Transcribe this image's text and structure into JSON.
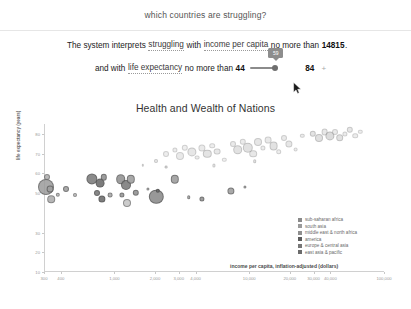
{
  "query": {
    "text": "which countries are struggling?"
  },
  "interpretation": {
    "line1": {
      "prefix": "The system interprets",
      "concept": "struggling",
      "connector": "with",
      "measure": "income per capita",
      "comparator": "no more than",
      "value": "14815",
      "period": "."
    },
    "line2": {
      "prefix": "and with",
      "measure": "life expectancy",
      "comparator": "no more than",
      "min_value": "44",
      "slider_tooltip": "59",
      "max_value": "84",
      "add_label": "+"
    }
  },
  "chart_data": {
    "type": "scatter",
    "title": "Health and Wealth of Nations",
    "xlabel": "income per capita, inflation-adjusted (dollars)",
    "ylabel": "life expectancy (years)",
    "xscale": "log",
    "xlim": [
      300,
      100000
    ],
    "ylim": [
      10,
      85
    ],
    "grid": false,
    "legend_position": "bottom-right",
    "xticks": [
      "300",
      "400",
      "1,000",
      "2,000",
      "3,000",
      "4,000",
      "10,000",
      "20,000",
      "30,000",
      "40,000",
      "100,000"
    ],
    "yticks": [
      "80",
      "70",
      "60",
      "50",
      "30",
      "20",
      "10"
    ],
    "legend": [
      {
        "label": "sub-saharan africa",
        "color": "#8a8a8a"
      },
      {
        "label": "south asia",
        "color": "#9a9a9a"
      },
      {
        "label": "middle east & north africa",
        "color": "#8f8f8f"
      },
      {
        "label": "america",
        "color": "#5c5c5c"
      },
      {
        "label": "europe & central asia",
        "color": "#777777"
      },
      {
        "label": "east asia & pacific",
        "color": "#6b6b6b"
      }
    ],
    "points": [
      {
        "x": 0.5,
        "y": 53,
        "r": 8.0,
        "c": "#9b9b9b",
        "o": 0.85
      },
      {
        "x": 1.0,
        "y": 58,
        "r": 3.0,
        "c": "#a8a8a8",
        "o": 0.8
      },
      {
        "x": 1.8,
        "y": 52,
        "r": 3.4,
        "c": "#9e9e9e",
        "o": 0.85
      },
      {
        "x": 2.2,
        "y": 47,
        "r": 3.8,
        "c": "#a5a5a5",
        "o": 0.8
      },
      {
        "x": 4.0,
        "y": 49,
        "r": 2.2,
        "c": "#b0b0b0",
        "o": 0.8
      },
      {
        "x": 6.5,
        "y": 52,
        "r": 3.0,
        "c": "#9c9c9c",
        "o": 0.85
      },
      {
        "x": 9.0,
        "y": 49,
        "r": 2.0,
        "c": "#b4b4b4",
        "o": 0.8
      },
      {
        "x": 14.0,
        "y": 57,
        "r": 5.6,
        "c": "#7c7c7c",
        "o": 0.88
      },
      {
        "x": 16.5,
        "y": 55,
        "r": 4.4,
        "c": "#6e6e6e",
        "o": 0.9
      },
      {
        "x": 17.5,
        "y": 58,
        "r": 3.2,
        "c": "#8b8b8b",
        "o": 0.85
      },
      {
        "x": 15.5,
        "y": 50,
        "r": 3.0,
        "c": "#777777",
        "o": 0.88
      },
      {
        "x": 17.0,
        "y": 47,
        "r": 3.6,
        "c": "#6f6f6f",
        "o": 0.9
      },
      {
        "x": 19.5,
        "y": 49,
        "r": 2.4,
        "c": "#a0a0a0",
        "o": 0.82
      },
      {
        "x": 22.5,
        "y": 57,
        "r": 4.8,
        "c": "#8e8e8e",
        "o": 0.85
      },
      {
        "x": 24.0,
        "y": 54,
        "r": 5.0,
        "c": "#7a7a7a",
        "o": 0.88
      },
      {
        "x": 25.5,
        "y": 57,
        "r": 4.2,
        "c": "#9a9a9a",
        "o": 0.85
      },
      {
        "x": 23.0,
        "y": 49,
        "r": 2.6,
        "c": "#909090",
        "o": 0.84
      },
      {
        "x": 24.5,
        "y": 45,
        "r": 4.0,
        "c": "#c0c0c0",
        "o": 0.8
      },
      {
        "x": 27.0,
        "y": 50,
        "r": 3.2,
        "c": "#8c8c8c",
        "o": 0.85
      },
      {
        "x": 30.5,
        "y": 52,
        "r": 1.6,
        "c": "#a6a6a6",
        "o": 0.8
      },
      {
        "x": 33.0,
        "y": 48,
        "r": 7.2,
        "c": "#8a8a8a",
        "o": 0.88
      },
      {
        "x": 33.5,
        "y": 51,
        "r": 2.2,
        "c": "#6c6c6c",
        "o": 0.9
      },
      {
        "x": 38.5,
        "y": 57,
        "r": 4.2,
        "c": "#989898",
        "o": 0.85
      },
      {
        "x": 42.5,
        "y": 48,
        "r": 1.8,
        "c": "#a4a4a4",
        "o": 0.82
      },
      {
        "x": 46.5,
        "y": 47,
        "r": 2.6,
        "c": "#8f8f8f",
        "o": 0.85
      },
      {
        "x": 55.0,
        "y": 51,
        "r": 3.6,
        "c": "#9b9b9b",
        "o": 0.85
      },
      {
        "x": 59.0,
        "y": 53,
        "r": 1.6,
        "c": "#a0a0a0",
        "o": 0.8
      },
      {
        "x": 33.0,
        "y": 66,
        "r": 2.0,
        "c": "#d8d8d8",
        "o": 0.55
      },
      {
        "x": 36.0,
        "y": 70,
        "r": 3.0,
        "c": "#dcdcdc",
        "o": 0.5
      },
      {
        "x": 38.5,
        "y": 72,
        "r": 2.6,
        "c": "#dadada",
        "o": 0.5
      },
      {
        "x": 40.0,
        "y": 69,
        "r": 4.0,
        "c": "#d5d5d5",
        "o": 0.5
      },
      {
        "x": 41.5,
        "y": 73,
        "r": 3.2,
        "c": "#dedede",
        "o": 0.5
      },
      {
        "x": 43.5,
        "y": 71,
        "r": 4.6,
        "c": "#d2d2d2",
        "o": 0.55
      },
      {
        "x": 45.0,
        "y": 68,
        "r": 2.4,
        "c": "#dbdbdb",
        "o": 0.5
      },
      {
        "x": 46.5,
        "y": 73,
        "r": 3.6,
        "c": "#d7d7d7",
        "o": 0.5
      },
      {
        "x": 48.0,
        "y": 70,
        "r": 4.2,
        "c": "#cfcfcf",
        "o": 0.55
      },
      {
        "x": 49.5,
        "y": 74,
        "r": 2.8,
        "c": "#dddddd",
        "o": 0.5
      },
      {
        "x": 51.0,
        "y": 71,
        "r": 3.4,
        "c": "#d4d4d4",
        "o": 0.52
      },
      {
        "x": 53.0,
        "y": 67,
        "r": 2.2,
        "c": "#dededede",
        "o": 0.5
      },
      {
        "x": 55.5,
        "y": 75,
        "r": 3.0,
        "c": "#d6d6d6",
        "o": 0.5
      },
      {
        "x": 57.0,
        "y": 72,
        "r": 4.8,
        "c": "#cccccc",
        "o": 0.55
      },
      {
        "x": 58.5,
        "y": 76,
        "r": 3.2,
        "c": "#d9d9d9",
        "o": 0.5
      },
      {
        "x": 60.0,
        "y": 73,
        "r": 5.2,
        "c": "#c9c9c9",
        "o": 0.55
      },
      {
        "x": 61.5,
        "y": 70,
        "r": 3.8,
        "c": "#d3d3d3",
        "o": 0.52
      },
      {
        "x": 63.0,
        "y": 76,
        "r": 4.0,
        "c": "#d0d0d0",
        "o": 0.52
      },
      {
        "x": 64.5,
        "y": 73,
        "r": 2.6,
        "c": "#dadada",
        "o": 0.5
      },
      {
        "x": 66.0,
        "y": 77,
        "r": 3.4,
        "c": "#d5d5d5",
        "o": 0.5
      },
      {
        "x": 67.5,
        "y": 74,
        "r": 4.4,
        "c": "#cbcbcb",
        "o": 0.55
      },
      {
        "x": 69.0,
        "y": 71,
        "r": 2.8,
        "c": "#dcdcdc",
        "o": 0.5
      },
      {
        "x": 70.5,
        "y": 78,
        "r": 3.0,
        "c": "#d7d7d7",
        "o": 0.5
      },
      {
        "x": 72.0,
        "y": 75,
        "r": 3.6,
        "c": "#d1d1d1",
        "o": 0.52
      },
      {
        "x": 74.0,
        "y": 72,
        "r": 2.4,
        "c": "#dddddd",
        "o": 0.5
      },
      {
        "x": 76.0,
        "y": 79,
        "r": 2.2,
        "c": "#d8d8d8",
        "o": 0.5
      },
      {
        "x": 79.0,
        "y": 80,
        "r": 3.2,
        "c": "#cdcdcd",
        "o": 0.55
      },
      {
        "x": 81.0,
        "y": 78,
        "r": 4.0,
        "c": "#c7c7c7",
        "o": 0.55
      },
      {
        "x": 82.5,
        "y": 81,
        "r": 3.4,
        "c": "#d2d2d2",
        "o": 0.52
      },
      {
        "x": 84.0,
        "y": 79,
        "r": 4.6,
        "c": "#c4c4c4",
        "o": 0.58
      },
      {
        "x": 85.5,
        "y": 81,
        "r": 3.0,
        "c": "#d6d6d6",
        "o": 0.5
      },
      {
        "x": 87.0,
        "y": 78,
        "r": 3.8,
        "c": "#cacaca",
        "o": 0.55
      },
      {
        "x": 88.5,
        "y": 80,
        "r": 2.6,
        "c": "#d9d9d9",
        "o": 0.5
      },
      {
        "x": 90.0,
        "y": 82,
        "r": 3.2,
        "c": "#d0d0d0",
        "o": 0.52
      },
      {
        "x": 91.5,
        "y": 79,
        "r": 2.8,
        "c": "#dbdbdb",
        "o": 0.5
      },
      {
        "x": 93.0,
        "y": 81,
        "r": 2.2,
        "c": "#dedede",
        "o": 0.5
      },
      {
        "x": 36.0,
        "y": 63,
        "r": 1.4,
        "c": "#cfcfcf",
        "o": 0.6
      },
      {
        "x": 29.0,
        "y": 64,
        "r": 1.2,
        "c": "#d4d4d4",
        "o": 0.55
      },
      {
        "x": 50.0,
        "y": 64,
        "r": 1.6,
        "c": "#d6d6d6",
        "o": 0.55
      },
      {
        "x": 62.0,
        "y": 66,
        "r": 1.8,
        "c": "#d2d2d2",
        "o": 0.55
      }
    ]
  }
}
